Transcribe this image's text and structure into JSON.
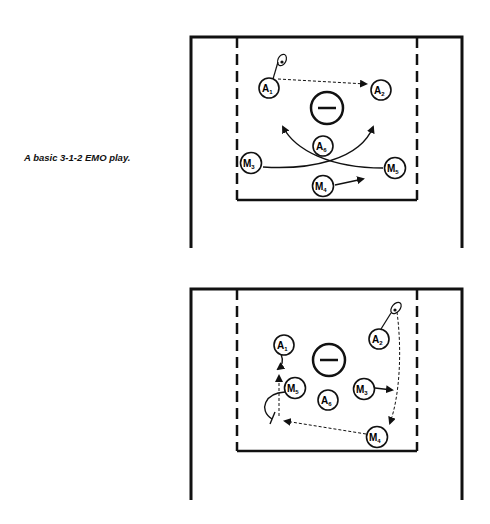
{
  "caption": "A basic 3-1-2 EMO play.",
  "colors": {
    "ink": "#111111",
    "background": "#ffffff"
  },
  "diagrams": [
    {
      "id": "play-setup",
      "goal_symbol": "minus-in-circle",
      "players": [
        {
          "label": "A",
          "sub": "1",
          "x": 269,
          "y": 88
        },
        {
          "label": "A",
          "sub": "2",
          "x": 381,
          "y": 90
        },
        {
          "label": "A",
          "sub": "6",
          "x": 323,
          "y": 146
        },
        {
          "label": "M",
          "sub": "3",
          "x": 251,
          "y": 163
        },
        {
          "label": "M",
          "sub": "5",
          "x": 395,
          "y": 168
        },
        {
          "label": "M",
          "sub": "4",
          "x": 323,
          "y": 186
        }
      ]
    },
    {
      "id": "play-continuation",
      "goal_symbol": "minus-in-circle",
      "players": [
        {
          "label": "A",
          "sub": "1",
          "x": 284,
          "y": 345
        },
        {
          "label": "A",
          "sub": "2",
          "x": 379,
          "y": 339
        },
        {
          "label": "M",
          "sub": "5",
          "x": 295,
          "y": 388
        },
        {
          "label": "A",
          "sub": "6",
          "x": 328,
          "y": 400
        },
        {
          "label": "M",
          "sub": "3",
          "x": 364,
          "y": 389
        },
        {
          "label": "M",
          "sub": "4",
          "x": 377,
          "y": 437
        }
      ]
    }
  ]
}
